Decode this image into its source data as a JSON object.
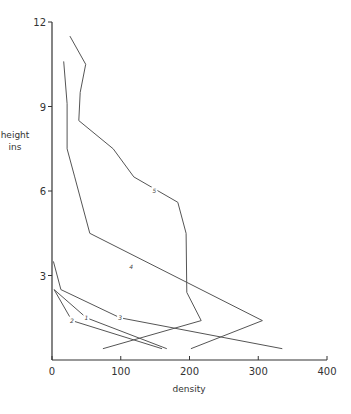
{
  "chart_data": {
    "type": "line",
    "title": "",
    "xlabel": "density",
    "ylabel": "height\nins",
    "ylabel_lines": [
      "height",
      "ins"
    ],
    "xlim": [
      0,
      400
    ],
    "ylim": [
      0,
      12
    ],
    "x_ticks": [
      0,
      100,
      200,
      300,
      400
    ],
    "y_ticks": [
      3,
      6,
      9,
      12
    ],
    "grid": false,
    "legend": "none (curves labeled inline 1-5)",
    "series": [
      {
        "name": "1",
        "points": [
          [
            3,
            2.5
          ],
          [
            50,
            1.5
          ],
          [
            167,
            0.4
          ]
        ],
        "label_at": [
          50,
          1.5
        ]
      },
      {
        "name": "2",
        "points": [
          [
            3,
            2.5
          ],
          [
            29,
            1.4
          ],
          [
            160,
            0.4
          ]
        ],
        "label_at": [
          29,
          1.4
        ]
      },
      {
        "name": "3",
        "points": [
          [
            2,
            3.5
          ],
          [
            13,
            2.5
          ],
          [
            99,
            1.5
          ],
          [
            335,
            0.4
          ]
        ],
        "label_at": [
          99,
          1.5
        ]
      },
      {
        "name": "4",
        "points": [
          [
            17,
            10.6
          ],
          [
            22,
            9.1
          ],
          [
            22,
            7.5
          ],
          [
            33,
            6.5
          ],
          [
            55,
            4.5
          ],
          [
            306,
            1.4
          ],
          [
            202,
            0.4
          ]
        ],
        "label_at": [
          115,
          3.3
        ]
      },
      {
        "name": "5",
        "points": [
          [
            26,
            11.5
          ],
          [
            49,
            10.5
          ],
          [
            41,
            9.5
          ],
          [
            39,
            8.5
          ],
          [
            89,
            7.5
          ],
          [
            119,
            6.5
          ],
          [
            183,
            5.6
          ],
          [
            195,
            4.5
          ],
          [
            196,
            2.4
          ],
          [
            217,
            1.4
          ],
          [
            74,
            0.4
          ]
        ],
        "label_at": [
          149,
          6.0
        ]
      }
    ]
  },
  "style": {
    "line_color": "#555555",
    "axis_color": "#333333"
  }
}
